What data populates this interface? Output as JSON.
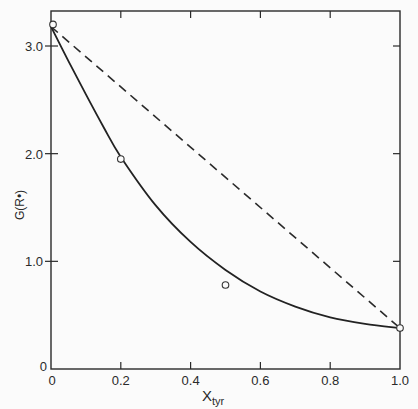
{
  "chart_data": {
    "type": "line",
    "title": "",
    "xlabel": "X_tyr",
    "xlabel_main": "X",
    "xlabel_sub": "tyr",
    "ylabel": "G(R•)",
    "xlim": [
      0,
      1.0
    ],
    "ylim": [
      0,
      3.3
    ],
    "x_ticks": [
      "0",
      "0.2",
      "0.4",
      "0.6",
      "0.8",
      "1.0"
    ],
    "x_tick_values": [
      0,
      0.2,
      0.4,
      0.6,
      0.8,
      1.0
    ],
    "y_ticks": [
      "0",
      "1.0",
      "2.0",
      "3.0"
    ],
    "y_tick_values": [
      0,
      1.0,
      2.0,
      3.0
    ],
    "grid": false,
    "legend": null,
    "series": [
      {
        "name": "fitted curve",
        "style": "solid",
        "x": [
          0,
          0.05,
          0.1,
          0.15,
          0.2,
          0.3,
          0.4,
          0.5,
          0.6,
          0.7,
          0.8,
          0.9,
          1.0
        ],
        "values": [
          3.18,
          2.86,
          2.55,
          2.25,
          1.97,
          1.52,
          1.18,
          0.92,
          0.72,
          0.58,
          0.48,
          0.42,
          0.38
        ]
      },
      {
        "name": "linear (ideal mixing)",
        "style": "dashed",
        "x": [
          0,
          1.0
        ],
        "values": [
          3.18,
          0.38
        ]
      },
      {
        "name": "measured",
        "style": "open-circle markers",
        "x": [
          0,
          0.2,
          0.5,
          1.0
        ],
        "values": [
          3.2,
          1.95,
          0.78,
          0.38
        ]
      }
    ]
  }
}
